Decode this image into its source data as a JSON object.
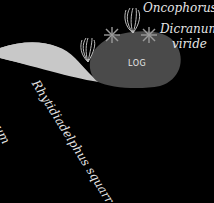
{
  "diagram": {
    "log": {
      "label": "LOG",
      "color": "#4a4a4a"
    },
    "slope": {
      "color": "#c8c8c8"
    },
    "labels": {
      "oncophorus": "Oncophorus",
      "dicranum_line1": "Dicranum",
      "dicranum_line2": "viride",
      "rhytidiadelphus": "Rhytidiadelphus squarrosus",
      "partial_left": "icum"
    },
    "colors": {
      "background": "#000000",
      "text": "#e6e6e6",
      "moss_symbol": "#bdbdbd"
    }
  }
}
